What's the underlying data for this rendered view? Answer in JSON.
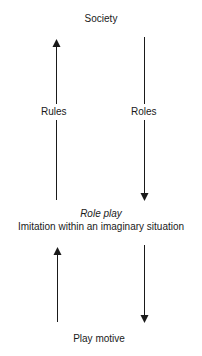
{
  "diagram": {
    "top_node": "Society",
    "middle_node": {
      "title": "Role play",
      "subtitle": "Imitation within an imaginary situation"
    },
    "bottom_node": "Play motive",
    "upper_arrows": {
      "left": {
        "label": "Rules",
        "direction": "up"
      },
      "right": {
        "label": "Roles",
        "direction": "down"
      }
    },
    "lower_arrows": {
      "left": {
        "label": "",
        "direction": "up"
      },
      "right": {
        "label": "",
        "direction": "down"
      }
    },
    "line_color": "#1a1a1a"
  }
}
